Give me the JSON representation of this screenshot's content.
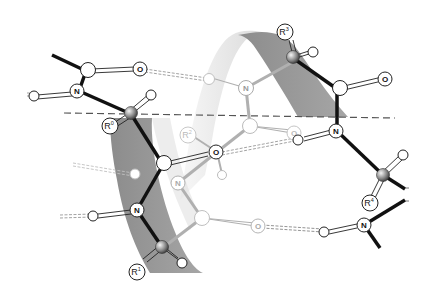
{
  "figure": {
    "colors": {
      "ribbon_dark": "#9a9a9a",
      "ribbon_light": "#e6e6e6",
      "bond_front": "#111111",
      "bond_back": "#a8a8a8",
      "atom_stroke": "#222222",
      "atom_faded_stroke": "#b5b5b5",
      "axis_dash": "#555555"
    },
    "atom_labels": {
      "oxygen": "O",
      "nitrogen": "N"
    },
    "residue_labels": [
      {
        "id": "R0",
        "base": "R",
        "sup": "0"
      },
      {
        "id": "R1",
        "base": "R",
        "sup": "1"
      },
      {
        "id": "R2",
        "base": "R",
        "sup": "2"
      },
      {
        "id": "R3",
        "base": "R",
        "sup": "3"
      },
      {
        "id": "R4",
        "base": "R",
        "sup": "4"
      }
    ]
  }
}
